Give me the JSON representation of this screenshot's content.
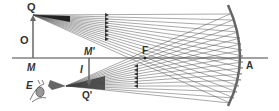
{
  "diagram": {
    "labels": {
      "object_top": "Q",
      "object": "O",
      "object_base": "M",
      "image_base": "M'",
      "image": "I",
      "image_top": "Q'",
      "focus": "F",
      "vertex": "A",
      "eye": "E"
    },
    "colors": {
      "rays": "#555555",
      "mirror": "#666666",
      "axis": "#444444",
      "arrow": "#666666",
      "text": "#333333"
    }
  }
}
